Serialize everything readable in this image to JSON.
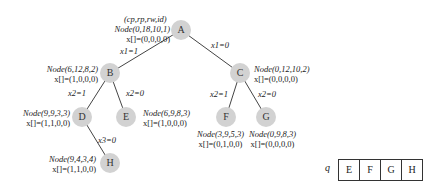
{
  "diagram": {
    "header_label": "(cp,rp,rw,id)",
    "nodes": {
      "A": {
        "id": "A",
        "node": "Node(0,18,10,1)",
        "x": "x[]=(0,0,0,0)"
      },
      "B": {
        "id": "B",
        "node": "Node(6,12,8,2)",
        "x": "x[]=(1,0,0,0)"
      },
      "C": {
        "id": "C",
        "node": "Node(0,12,10,2)",
        "x": "x[]=(0,0,0,0)"
      },
      "D": {
        "id": "D",
        "node": "Node(9,9,3,3)",
        "x": "x[]=(1,1,0,0)"
      },
      "E": {
        "id": "E",
        "node": "Node(6,9,8,3)",
        "x": "x[]=(1,0,0,0)"
      },
      "F": {
        "id": "F",
        "node": "Node(3,9,5,3)",
        "x": "x[]=(0,1,0,0)"
      },
      "G": {
        "id": "G",
        "node": "Node(0,9,8,3)",
        "x": "x[]=(0,0,0,0)"
      },
      "H": {
        "id": "H",
        "node": "Node(9,4,3,4)",
        "x": "x[]=(1,1,0,0)"
      }
    },
    "edges": {
      "AB": "x1=1",
      "AC": "x1=0",
      "BD": "x2=1",
      "BE": "x2=0",
      "CF": "x2=1",
      "CG": "x2=0",
      "DH": "x3=0"
    },
    "node_fill": "#d2d2d2",
    "queue": {
      "label": "q",
      "cells": [
        "E",
        "F",
        "G",
        "H"
      ]
    }
  }
}
